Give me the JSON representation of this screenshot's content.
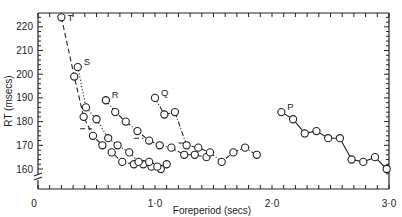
{
  "chart_data": {
    "type": "line",
    "title": "",
    "xlabel": "Foreperiod (secs)",
    "ylabel": "RT (msecs)",
    "xlim": [
      0,
      3.0
    ],
    "ylim": [
      155,
      226
    ],
    "x_tick_labels": [
      "0",
      "1·0",
      "2·0",
      "3·0"
    ],
    "y_tick_labels": [
      "160",
      "170",
      "180",
      "190",
      "200",
      "210",
      "220"
    ],
    "grid": false,
    "legend": "inline letter labels (P, Q, R, S, T)",
    "axis_break": "y-axis broken between 0 and 160",
    "series": [
      {
        "name": "T",
        "style": "dashed",
        "points": [
          [
            0.2,
            224
          ],
          [
            0.31,
            199
          ],
          [
            0.39,
            182
          ],
          [
            0.47,
            174
          ],
          [
            0.55,
            170
          ],
          [
            0.63,
            167
          ],
          [
            0.72,
            163
          ],
          [
            0.82,
            162
          ],
          [
            0.9,
            162
          ],
          [
            0.97,
            161
          ],
          [
            1.05,
            160
          ]
        ]
      },
      {
        "name": "S",
        "style": "dotted",
        "points": [
          [
            0.34,
            203
          ],
          [
            0.41,
            186
          ],
          [
            0.5,
            181
          ],
          [
            0.6,
            173
          ],
          [
            0.68,
            170
          ],
          [
            0.78,
            167
          ],
          [
            0.86,
            163
          ],
          [
            0.95,
            163
          ],
          [
            1.02,
            161
          ],
          [
            1.1,
            162
          ]
        ]
      },
      {
        "name": "R",
        "style": "dash-dot",
        "points": [
          [
            0.58,
            189
          ],
          [
            0.66,
            184
          ],
          [
            0.75,
            180
          ],
          [
            0.85,
            176
          ],
          [
            0.95,
            172
          ],
          [
            1.04,
            170
          ],
          [
            1.14,
            169
          ],
          [
            1.25,
            166
          ],
          [
            1.34,
            166
          ],
          [
            1.44,
            165
          ]
        ]
      },
      {
        "name": "Q",
        "style": "dash-dot",
        "points": [
          [
            1.0,
            190
          ],
          [
            1.08,
            183
          ],
          [
            1.17,
            184
          ],
          [
            1.27,
            170
          ],
          [
            1.37,
            169
          ],
          [
            1.47,
            167
          ],
          [
            1.57,
            163
          ],
          [
            1.67,
            167
          ],
          [
            1.77,
            169
          ],
          [
            1.87,
            166
          ]
        ]
      },
      {
        "name": "P",
        "style": "solid",
        "points": [
          [
            2.08,
            184
          ],
          [
            2.18,
            181
          ],
          [
            2.28,
            175
          ],
          [
            2.38,
            176
          ],
          [
            2.48,
            173
          ],
          [
            2.58,
            173
          ],
          [
            2.68,
            164
          ],
          [
            2.78,
            163
          ],
          [
            2.88,
            165
          ],
          [
            2.98,
            160
          ]
        ]
      }
    ],
    "asymptote_marks": [
      {
        "series": "T",
        "x_range": [
          0.36,
          0.46
        ],
        "y": 177
      },
      {
        "series": "R",
        "x_range": [
          0.82,
          0.9
        ],
        "y": 173
      },
      {
        "series": "Q",
        "x_range": [
          1.2,
          1.27
        ],
        "y": 171
      }
    ]
  }
}
